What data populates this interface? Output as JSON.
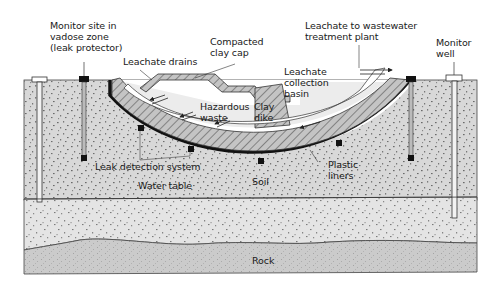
{
  "diagram": {
    "colors": {
      "background": "#ffffff",
      "soil": "#d6d6d6",
      "groundwater_zone": "#e2e2e2",
      "rock": "#c9c9c9",
      "clay_hatch_fill": "#bdbdbd",
      "liner": "#111111",
      "outline": "#333333"
    },
    "labels": {
      "monitor_site": "Monitor site in\nvadose zone\n(leak protector)",
      "leachate_drains": "Leachate drains",
      "compacted_clay_cap": "Compacted\nclay cap",
      "leachate_to_plant": "Leachate to wastewater\ntreatment plant",
      "monitor_well": "Monitor\nwell",
      "leachate_collection_basin": "Leachate\ncollection\nbasin",
      "hazardous_waste": "Hazardous\nwaste",
      "clay_dike": "Clay\ndike",
      "leak_detection_system": "Leak detection system",
      "water_table": "Water table",
      "soil": "Soil",
      "plastic_liners": "Plastic\nliners",
      "rock": "Rock"
    }
  }
}
